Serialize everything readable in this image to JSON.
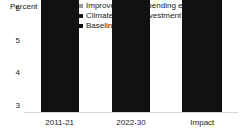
{
  "chart_data": {
    "type": "bar",
    "title": "",
    "subtitle": "",
    "xlabel": "",
    "ylabel": "Percent",
    "categories": [
      "2011-21",
      "2022-30",
      "Impact"
    ],
    "ylim": [
      3,
      6
    ],
    "yticks": [
      3,
      4,
      5,
      6
    ],
    "ytick_labels": [
      "3",
      "4",
      "5",
      "6"
    ],
    "grid": false,
    "stacked": true,
    "legend_position": "top-right",
    "legend": [
      {
        "name": "Improvement in spending efficiency",
        "color": "#9a9a9a"
      },
      {
        "name": "Climate-related investment boost",
        "color": "#1a1a1a"
      },
      {
        "name": "Baseline",
        "color": "#111111"
      }
    ],
    "series": [
      {
        "name": "Baseline",
        "color": "#111111",
        "values": [
          3.6,
          3.47,
          3.55
        ]
      },
      {
        "name": "Climate-related investment boost",
        "color": "#1a1a1a",
        "values": [
          0,
          0,
          0.06
        ]
      },
      {
        "name": "Improvement in spending efficiency",
        "color": "#9a9a9a",
        "values": [
          0,
          0,
          0.06
        ]
      }
    ],
    "bars": [
      {
        "category": "2011-21",
        "total": 3.6,
        "segments": [
          {
            "series": "Baseline",
            "value": 3.6,
            "color": "#111111"
          }
        ]
      },
      {
        "category": "2022-30",
        "total": 3.47,
        "segments": [
          {
            "series": "Baseline",
            "value": 3.47,
            "color": "#111111"
          }
        ]
      },
      {
        "category": "Impact",
        "total": 3.67,
        "segments": [
          {
            "series": "Baseline",
            "value": 3.55,
            "color": "#111111"
          },
          {
            "series": "Climate-related investment boost",
            "value": 0.06,
            "color": "#1a1a1a"
          },
          {
            "series": "Improvement in spending efficiency",
            "value": 0.06,
            "color": "#9a9a9a"
          }
        ]
      }
    ],
    "axis_unit_label": "Percent",
    "axis_line_color": "#d9d9d9",
    "background_color": "#ffffff",
    "text_color": "#1a1a1a"
  }
}
